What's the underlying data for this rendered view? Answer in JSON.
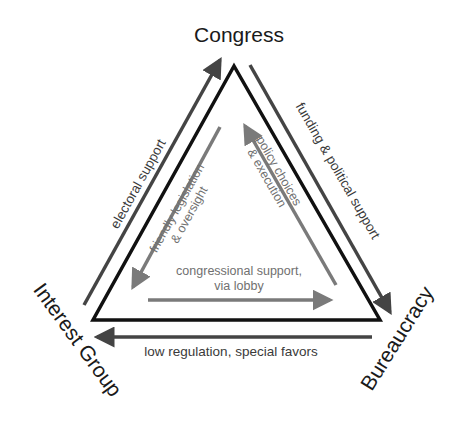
{
  "diagram": {
    "type": "iron-triangle",
    "colors": {
      "triangle": "#111111",
      "outer_arrow": "#444444",
      "inner_arrow": "#7a7a7a",
      "node_text": "#1a1a1a",
      "outer_text": "#3a3a3a",
      "inner_text": "#707070"
    },
    "nodes": {
      "top": "Congress",
      "left": "Interest Group",
      "right": "Bureaucracy"
    },
    "outer_arrows": {
      "left_side": {
        "label": "electoral support",
        "from": "Interest Group",
        "to": "Congress"
      },
      "right_side": {
        "label": "funding & political support",
        "from": "Congress",
        "to": "Bureaucracy"
      },
      "bottom_side": {
        "label": "low regulation, special favors",
        "from": "Bureaucracy",
        "to": "Interest Group"
      }
    },
    "inner_arrows": {
      "left_side": {
        "label_line1": "friendly legislation",
        "label_line2": "& oversight",
        "from": "Congress",
        "to": "Interest Group"
      },
      "right_side": {
        "label_line1": "policy choices",
        "label_line2": "& execution",
        "from": "Bureaucracy",
        "to": "Congress"
      },
      "bottom_side": {
        "label_line1": "congressional support,",
        "label_line2": "via lobby",
        "from": "Interest Group",
        "to": "Bureaucracy"
      }
    }
  }
}
